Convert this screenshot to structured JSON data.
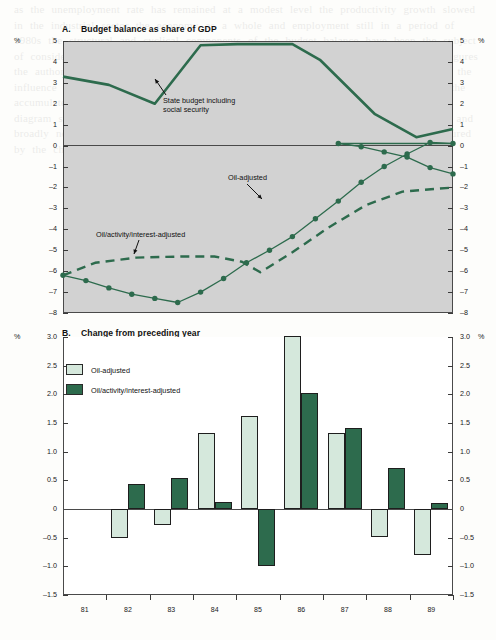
{
  "figure": {
    "bleed_text": "as the unemployment rate has remained at a modest level the productivity growth slowed in the industrial sector the economy as a whole and employment still in a period of 1980s the structural and cyclical components of the budget balance have been the subject of considerable the oil sector in revenues and the importance in the total adjusted figures the authorities have estimated the so called activity corrected balance which excludes the influence of automatic stabilisers over the cycle and interest payments which reflect the accumulated stock of debt the resulting indicator shown in the lower panel of the diagram suggests that fiscal policy was expansionary in the early part of the decade and broadly neutral thereafter with a modest tightening in the most recent years as measured by the change in the adjusted balance"
  },
  "panelA": {
    "letter": "A.",
    "title": "Budget balance as share of GDP",
    "unit_left": "%",
    "unit_right": "%",
    "y_ticks": [
      "5",
      "4",
      "3",
      "2",
      "1",
      "0",
      "-1",
      "-2",
      "-3",
      "-4",
      "-5",
      "-6",
      "-7",
      "-8"
    ],
    "ylim": [
      -8,
      5
    ],
    "annotations": [
      {
        "name": "state-budget",
        "text_line1": "State budget including",
        "text_line2": "social security"
      },
      {
        "name": "oil-adjusted",
        "text_line1": "Oil-adjusted",
        "text_line2": ""
      },
      {
        "name": "oil-activity-interest-adjusted",
        "text_line1": "Oil/activity/interest-adjusted",
        "text_line2": ""
      }
    ]
  },
  "panelB": {
    "letter": "B.",
    "title": "Change from preceding year",
    "unit_left": "%",
    "unit_right": "%",
    "y_ticks": [
      "3.0",
      "2.5",
      "2.0",
      "1.5",
      "1.0",
      "0.5",
      "0",
      "-0.5",
      "-1.0",
      "-1.5"
    ],
    "ylim": [
      -1.5,
      3.0
    ],
    "legend": [
      {
        "label": "Oil-adjusted",
        "color": "#d5e8dc"
      },
      {
        "label": "Oil/activity/interest-adjusted",
        "color": "#2d6b4d"
      }
    ]
  },
  "colors": {
    "dark_green": "#2d6b4d",
    "light_green": "#d5e8dc",
    "panelA_bg": "#d2d2d2",
    "axis": "#3a3a3a"
  },
  "chart_data": [
    {
      "id": "panelA",
      "type": "line",
      "title": "A. Budget balance as share of GDP",
      "xlabel": "",
      "ylabel": "%",
      "ylim": [
        -8,
        5
      ],
      "xlim": [
        1981,
        1989.5
      ],
      "grid": false,
      "legend": "annotated inline",
      "x": [
        1981,
        1981.5,
        1982,
        1982.5,
        1983,
        1983.5,
        1984,
        1984.5,
        1985,
        1985.5,
        1986,
        1986.5,
        1987,
        1987.5,
        1988,
        1988.5,
        1989,
        1989.5
      ],
      "series": [
        {
          "name": "State budget including social security",
          "style": "solid-thick",
          "markers": false,
          "x": [
            1981,
            1982,
            1983,
            1984,
            1984.8,
            1986,
            1986.6,
            1987.8,
            1988.7,
            1989.5
          ],
          "values": [
            3.3,
            2.9,
            2.0,
            4.8,
            4.85,
            4.85,
            4.1,
            1.5,
            0.4,
            0.8
          ]
        },
        {
          "name": "Oil-adjusted",
          "style": "solid-thin-markers",
          "markers": true,
          "x": [
            1981,
            1981.5,
            1982,
            1982.5,
            1983,
            1983.5,
            1984,
            1984.5,
            1985,
            1985.5,
            1986,
            1986.5,
            1987,
            1987.5,
            1988,
            1988.5,
            1989,
            1989.5
          ],
          "values": [
            -6.2,
            -6.45,
            -6.8,
            -7.1,
            -7.3,
            -7.5,
            -7.0,
            -6.35,
            -5.6,
            -5.0,
            -4.35,
            -3.5,
            -2.65,
            -1.75,
            -1.0,
            -0.4,
            0.15,
            0.1
          ]
        },
        {
          "name": "Oil-adjusted (tail)",
          "style": "solid-thin-markers",
          "markers": true,
          "x": [
            1986.5,
            1987,
            1987.5,
            1988,
            1988.5,
            1989,
            1989.5
          ],
          "values": [
            0.15,
            0.1,
            -0.05,
            -0.3,
            -0.55,
            -1.05,
            -1.35
          ]
        },
        {
          "name": "Oil/activity/interest-adjusted",
          "style": "dashed",
          "markers": false,
          "x": [
            1981,
            1981.7,
            1982.6,
            1983.6,
            1984.3,
            1984.9,
            1985.3,
            1986,
            1986.8,
            1987.6,
            1988.4,
            1989.5
          ],
          "values": [
            -6.2,
            -5.6,
            -5.35,
            -5.3,
            -5.3,
            -5.55,
            -6.05,
            -5.1,
            -3.9,
            -2.85,
            -2.2,
            -2.0
          ]
        }
      ]
    },
    {
      "id": "panelB",
      "type": "bar",
      "title": "B. Change from preceding year",
      "xlabel": "",
      "ylabel": "%",
      "ylim": [
        -1.5,
        3.0
      ],
      "grid": false,
      "legend_position": "top-left",
      "categories": [
        "81",
        "82",
        "83",
        "84",
        "85",
        "86",
        "87",
        "88",
        "89"
      ],
      "series": [
        {
          "name": "Oil-adjusted",
          "color": "#d5e8dc",
          "values": [
            null,
            -0.5,
            -0.28,
            1.33,
            1.62,
            3.02,
            1.32,
            -0.48,
            -0.8
          ]
        },
        {
          "name": "Oil/activity/interest-adjusted",
          "color": "#2d6b4d",
          "values": [
            null,
            0.43,
            0.54,
            0.13,
            -1.0,
            2.02,
            1.42,
            0.72,
            0.1
          ]
        }
      ]
    }
  ]
}
